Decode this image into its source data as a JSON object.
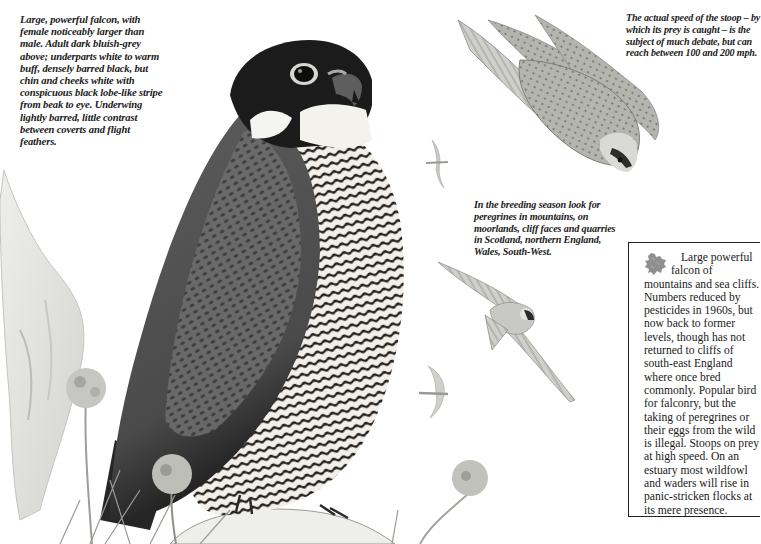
{
  "page": {
    "type": "field guide species page"
  },
  "captions": {
    "description": "Large, powerful falcon, with female noticeably larger than male. Adult dark bluish-grey above; underparts white to warm buff, densely barred black, but chin and cheeks white with conspicuous black lobe-like stripe from beak to eye. Underwing lightly barred, little contrast between coverts and flight feathers.",
    "speed": "The actual speed of the stoop – by which its prey is caught – is the subject of much debate, but can reach between 100 and 200 mph.",
    "breeding": "In the breeding season look for peregrines in mountains, on moorlands, cliff faces and quarries in Scotland, northern England, Wales, South-West."
  },
  "infobox": {
    "icon": "britain-map-icon",
    "text_lead": "Large powerful falcon of",
    "text_body": "mountains and sea cliffs. Numbers reduced by pesticides in 1960s, but now back to former levels, though has not returned to cliffs of south-east England where once bred commonly. Popular bird for falconry, but the taking of peregrines or their eggs from the wild is illegal. Stoops on prey at high speed. On an estuary most wildfowl and waders will rise in panic-stricken flocks at its mere presence."
  },
  "illustrations": {
    "main": "perched-peregrine-illustration",
    "stoop": "stooping-peregrine-illustration",
    "flight": "flying-peregrine-illustration",
    "distant_1": "distant-falcon-silhouette",
    "distant_2": "distant-falcon-silhouette",
    "background": "cliff-and-thrift-flowers"
  }
}
